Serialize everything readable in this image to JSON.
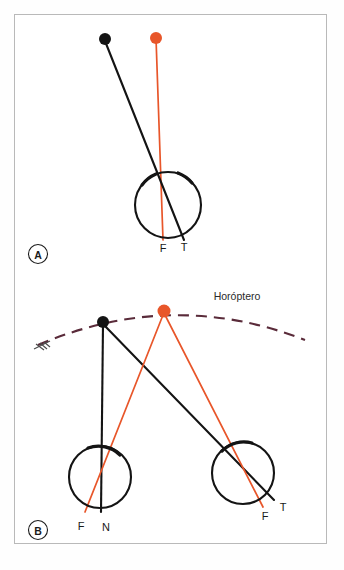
{
  "figure": {
    "background": "#ffffff",
    "frame_color": "#b9b9b9",
    "colors": {
      "black": "#141414",
      "orange": "#e8562a",
      "dashed_arc": "#5a2b3a",
      "frame": "#b9b9b9"
    }
  },
  "panels": [
    {
      "id": "A",
      "letter": "A",
      "description": "Single eye with fixation and temporal projection lines",
      "points": [
        {
          "name": "black-target-dot",
          "color": "#141414",
          "x": 105,
          "y": 39,
          "r": 6
        },
        {
          "name": "orange-target-dot",
          "color": "#e8562a",
          "x": 156,
          "y": 38,
          "r": 6
        }
      ],
      "eyes": [
        {
          "name": "eye-circle",
          "cx": 168,
          "cy": 205,
          "r": 33
        }
      ],
      "labels": [
        {
          "name": "label-F",
          "text": "F",
          "x": 163,
          "y": 250
        },
        {
          "name": "label-T",
          "text": "T",
          "x": 183,
          "y": 249
        }
      ]
    },
    {
      "id": "B",
      "letter": "B",
      "description": "Binocular view with horopter arc, two eyes, nasal and temporal projections",
      "arc_label": {
        "name": "horopter-label",
        "text": "Horóptero",
        "x": 237,
        "y": 298
      },
      "points": [
        {
          "name": "black-target-dot",
          "color": "#141414",
          "x": 103,
          "y": 322,
          "r": 6
        },
        {
          "name": "orange-target-dot",
          "color": "#e8562a",
          "x": 164,
          "y": 311,
          "r": 6.5
        }
      ],
      "eyes": [
        {
          "name": "eye-circle-left",
          "cx": 100,
          "cy": 477,
          "r": 31
        },
        {
          "name": "eye-circle-right",
          "cx": 243,
          "cy": 473,
          "r": 31
        }
      ],
      "labels": [
        {
          "name": "label-F-left",
          "text": "F",
          "x": 81,
          "y": 528
        },
        {
          "name": "label-N-left",
          "text": "N",
          "x": 105,
          "y": 529
        },
        {
          "name": "label-F-right",
          "text": "F",
          "x": 265,
          "y": 518
        },
        {
          "name": "label-T-right",
          "text": "T",
          "x": 283,
          "y": 509
        }
      ]
    }
  ]
}
